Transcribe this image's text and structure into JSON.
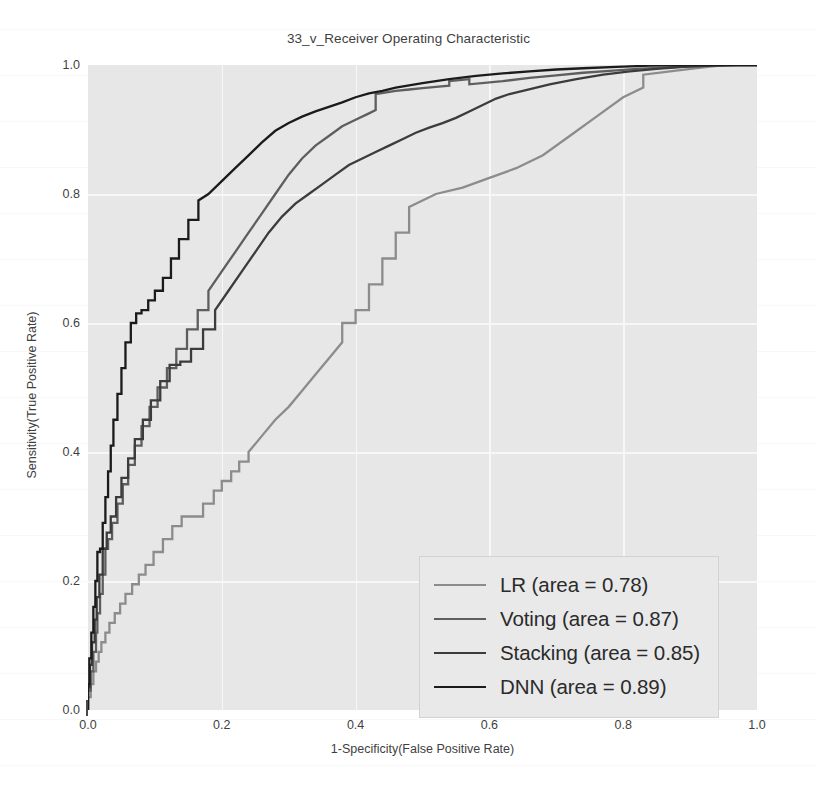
{
  "chart_data": {
    "type": "line",
    "title": "33_v_Receiver Operating Characteristic",
    "xlabel": "1-Specificity(False Positive Rate)",
    "ylabel": "Sensitivity(True Positive Rate)",
    "xlim": [
      0.0,
      1.0
    ],
    "ylim": [
      0.0,
      1.0
    ],
    "xticks": [
      "0.0",
      "0.2",
      "0.4",
      "0.6",
      "0.8",
      "1.0"
    ],
    "yticks": [
      "0.0",
      "0.2",
      "0.4",
      "0.6",
      "0.8",
      "1.0"
    ],
    "xtick_values": [
      0.0,
      0.2,
      0.4,
      0.6,
      0.8,
      1.0
    ],
    "ytick_values": [
      0.0,
      0.2,
      0.4,
      0.6,
      0.8,
      1.0
    ],
    "grid": true,
    "legend_position": "lower right",
    "plot_bgcolor": "#e7e7e7",
    "grid_color": "#f7f7f7",
    "series": [
      {
        "name": "LR",
        "area": 0.78,
        "legend_label": "LR (area = 0.78)",
        "color": "#8c8c8c",
        "x": [
          0.0,
          0.0,
          0.004,
          0.004,
          0.008,
          0.008,
          0.012,
          0.012,
          0.016,
          0.016,
          0.02,
          0.02,
          0.026,
          0.026,
          0.032,
          0.032,
          0.04,
          0.04,
          0.048,
          0.048,
          0.056,
          0.056,
          0.066,
          0.066,
          0.076,
          0.076,
          0.086,
          0.086,
          0.098,
          0.098,
          0.112,
          0.112,
          0.126,
          0.126,
          0.14,
          0.14,
          0.156,
          0.156,
          0.172,
          0.172,
          0.188,
          0.188,
          0.2,
          0.2,
          0.214,
          0.214,
          0.226,
          0.226,
          0.24,
          0.24,
          0.26,
          0.28,
          0.3,
          0.32,
          0.34,
          0.36,
          0.38,
          0.38,
          0.4,
          0.4,
          0.42,
          0.42,
          0.44,
          0.44,
          0.46,
          0.46,
          0.48,
          0.48,
          0.5,
          0.52,
          0.56,
          0.6,
          0.64,
          0.68,
          0.72,
          0.76,
          0.8,
          0.83,
          0.83,
          0.87,
          0.91,
          0.95,
          1.0
        ],
        "y": [
          0.0,
          0.02,
          0.02,
          0.04,
          0.04,
          0.06,
          0.06,
          0.075,
          0.075,
          0.09,
          0.09,
          0.105,
          0.105,
          0.12,
          0.12,
          0.135,
          0.135,
          0.15,
          0.15,
          0.165,
          0.165,
          0.18,
          0.18,
          0.195,
          0.195,
          0.21,
          0.21,
          0.225,
          0.225,
          0.245,
          0.245,
          0.265,
          0.265,
          0.285,
          0.285,
          0.3,
          0.3,
          0.3,
          0.3,
          0.32,
          0.32,
          0.34,
          0.34,
          0.355,
          0.355,
          0.37,
          0.37,
          0.385,
          0.385,
          0.4,
          0.425,
          0.45,
          0.47,
          0.495,
          0.52,
          0.545,
          0.57,
          0.6,
          0.6,
          0.62,
          0.62,
          0.66,
          0.66,
          0.7,
          0.7,
          0.74,
          0.74,
          0.78,
          0.79,
          0.8,
          0.81,
          0.825,
          0.84,
          0.86,
          0.89,
          0.92,
          0.95,
          0.965,
          0.985,
          0.99,
          0.995,
          1.0,
          1.0
        ]
      },
      {
        "name": "Voting",
        "area": 0.87,
        "legend_label": "Voting (area = 0.87)",
        "color": "#5e5e5e",
        "x": [
          0.0,
          0.0,
          0.004,
          0.004,
          0.008,
          0.008,
          0.012,
          0.012,
          0.014,
          0.014,
          0.018,
          0.018,
          0.022,
          0.022,
          0.026,
          0.026,
          0.03,
          0.03,
          0.036,
          0.036,
          0.044,
          0.044,
          0.052,
          0.052,
          0.06,
          0.06,
          0.07,
          0.07,
          0.08,
          0.08,
          0.092,
          0.092,
          0.104,
          0.104,
          0.118,
          0.118,
          0.132,
          0.132,
          0.148,
          0.148,
          0.164,
          0.164,
          0.18,
          0.18,
          0.2,
          0.22,
          0.24,
          0.26,
          0.28,
          0.3,
          0.32,
          0.34,
          0.36,
          0.38,
          0.4,
          0.42,
          0.43,
          0.43,
          0.46,
          0.48,
          0.5,
          0.52,
          0.54,
          0.54,
          0.57,
          0.57,
          0.62,
          0.66,
          0.7,
          0.74,
          0.78,
          0.82,
          0.86,
          0.9,
          0.94,
          0.97,
          1.0
        ],
        "y": [
          0.0,
          0.03,
          0.03,
          0.06,
          0.06,
          0.09,
          0.09,
          0.12,
          0.12,
          0.15,
          0.15,
          0.18,
          0.18,
          0.21,
          0.21,
          0.25,
          0.25,
          0.265,
          0.265,
          0.29,
          0.29,
          0.32,
          0.32,
          0.35,
          0.35,
          0.38,
          0.38,
          0.41,
          0.41,
          0.44,
          0.44,
          0.47,
          0.47,
          0.5,
          0.5,
          0.53,
          0.53,
          0.56,
          0.56,
          0.59,
          0.59,
          0.62,
          0.62,
          0.65,
          0.68,
          0.71,
          0.74,
          0.77,
          0.8,
          0.83,
          0.855,
          0.875,
          0.89,
          0.905,
          0.915,
          0.925,
          0.93,
          0.955,
          0.96,
          0.962,
          0.964,
          0.966,
          0.968,
          0.975,
          0.978,
          0.97,
          0.975,
          0.98,
          0.984,
          0.988,
          0.991,
          0.994,
          0.996,
          0.998,
          0.999,
          1.0,
          1.0
        ]
      },
      {
        "name": "Stacking",
        "area": 0.85,
        "legend_label": "Stacking (area = 0.85)",
        "color": "#3c3c3c",
        "x": [
          0.0,
          0.0,
          0.003,
          0.003,
          0.006,
          0.006,
          0.01,
          0.01,
          0.013,
          0.013,
          0.017,
          0.017,
          0.022,
          0.022,
          0.028,
          0.028,
          0.034,
          0.034,
          0.042,
          0.042,
          0.05,
          0.05,
          0.06,
          0.06,
          0.07,
          0.07,
          0.082,
          0.082,
          0.094,
          0.094,
          0.108,
          0.108,
          0.122,
          0.122,
          0.138,
          0.138,
          0.154,
          0.154,
          0.172,
          0.172,
          0.19,
          0.19,
          0.21,
          0.23,
          0.25,
          0.27,
          0.29,
          0.31,
          0.33,
          0.35,
          0.37,
          0.39,
          0.41,
          0.43,
          0.45,
          0.47,
          0.49,
          0.51,
          0.53,
          0.55,
          0.57,
          0.59,
          0.61,
          0.63,
          0.65,
          0.69,
          0.73,
          0.77,
          0.81,
          0.85,
          0.89,
          0.93,
          0.97,
          1.0
        ],
        "y": [
          0.0,
          0.035,
          0.035,
          0.07,
          0.07,
          0.105,
          0.105,
          0.14,
          0.14,
          0.175,
          0.175,
          0.21,
          0.21,
          0.25,
          0.25,
          0.275,
          0.275,
          0.3,
          0.3,
          0.33,
          0.33,
          0.36,
          0.36,
          0.39,
          0.39,
          0.42,
          0.42,
          0.45,
          0.45,
          0.48,
          0.48,
          0.51,
          0.51,
          0.535,
          0.535,
          0.54,
          0.54,
          0.56,
          0.56,
          0.59,
          0.59,
          0.62,
          0.65,
          0.68,
          0.71,
          0.74,
          0.765,
          0.785,
          0.8,
          0.815,
          0.83,
          0.845,
          0.855,
          0.865,
          0.875,
          0.885,
          0.895,
          0.903,
          0.91,
          0.918,
          0.928,
          0.938,
          0.948,
          0.955,
          0.96,
          0.97,
          0.978,
          0.985,
          0.99,
          0.994,
          0.997,
          0.999,
          1.0,
          1.0
        ]
      },
      {
        "name": "DNN",
        "area": 0.89,
        "legend_label": "DNN (area = 0.89)",
        "color": "#1b1b1b",
        "x": [
          0.0,
          0.0,
          0.002,
          0.002,
          0.005,
          0.005,
          0.008,
          0.008,
          0.011,
          0.011,
          0.014,
          0.014,
          0.018,
          0.018,
          0.022,
          0.022,
          0.026,
          0.026,
          0.03,
          0.03,
          0.034,
          0.034,
          0.038,
          0.038,
          0.044,
          0.044,
          0.05,
          0.05,
          0.056,
          0.056,
          0.064,
          0.064,
          0.072,
          0.072,
          0.08,
          0.08,
          0.09,
          0.09,
          0.1,
          0.1,
          0.112,
          0.112,
          0.124,
          0.124,
          0.136,
          0.136,
          0.15,
          0.15,
          0.165,
          0.165,
          0.18,
          0.2,
          0.22,
          0.24,
          0.26,
          0.28,
          0.3,
          0.32,
          0.34,
          0.36,
          0.38,
          0.4,
          0.42,
          0.44,
          0.46,
          0.5,
          0.54,
          0.58,
          0.62,
          0.66,
          0.7,
          0.74,
          0.79,
          0.84,
          0.89,
          0.94,
          1.0
        ],
        "y": [
          0.0,
          0.04,
          0.04,
          0.08,
          0.08,
          0.12,
          0.12,
          0.16,
          0.16,
          0.2,
          0.2,
          0.245,
          0.245,
          0.25,
          0.25,
          0.29,
          0.29,
          0.33,
          0.33,
          0.37,
          0.37,
          0.41,
          0.41,
          0.45,
          0.45,
          0.49,
          0.49,
          0.53,
          0.53,
          0.57,
          0.57,
          0.6,
          0.6,
          0.615,
          0.615,
          0.62,
          0.62,
          0.635,
          0.635,
          0.65,
          0.65,
          0.67,
          0.67,
          0.7,
          0.7,
          0.73,
          0.73,
          0.76,
          0.76,
          0.79,
          0.8,
          0.82,
          0.84,
          0.86,
          0.88,
          0.898,
          0.91,
          0.92,
          0.928,
          0.935,
          0.942,
          0.95,
          0.956,
          0.96,
          0.965,
          0.972,
          0.978,
          0.983,
          0.987,
          0.99,
          0.993,
          0.995,
          0.997,
          0.999,
          1.0,
          1.0,
          1.0
        ]
      }
    ]
  }
}
